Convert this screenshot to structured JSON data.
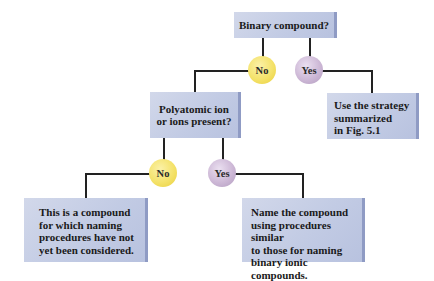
{
  "diagram": {
    "type": "decision-flowchart",
    "root": {
      "question": "Binary compound?",
      "branches": {
        "no_label": "No",
        "yes_label": "Yes"
      }
    },
    "yes_outcome": "Use the strategy\nsummarized\nin Fig. 5.1",
    "second_question": "Polyatomic ion\nor ions present?",
    "second_branches": {
      "no_label": "No",
      "yes_label": "Yes"
    },
    "second_no_outcome": "This is a compound\nfor which naming\nprocedures have not\nyet been considered.",
    "second_yes_outcome": "Name the compound\nusing procedures similar\nto those for naming\nbinary ionic compounds."
  },
  "colors": {
    "box_fill": "#c2cbe4",
    "box_edge": "#8f9bc4",
    "no_circle": "#f4e26a",
    "yes_circle": "#cdb8d6",
    "connector": "#222222"
  }
}
